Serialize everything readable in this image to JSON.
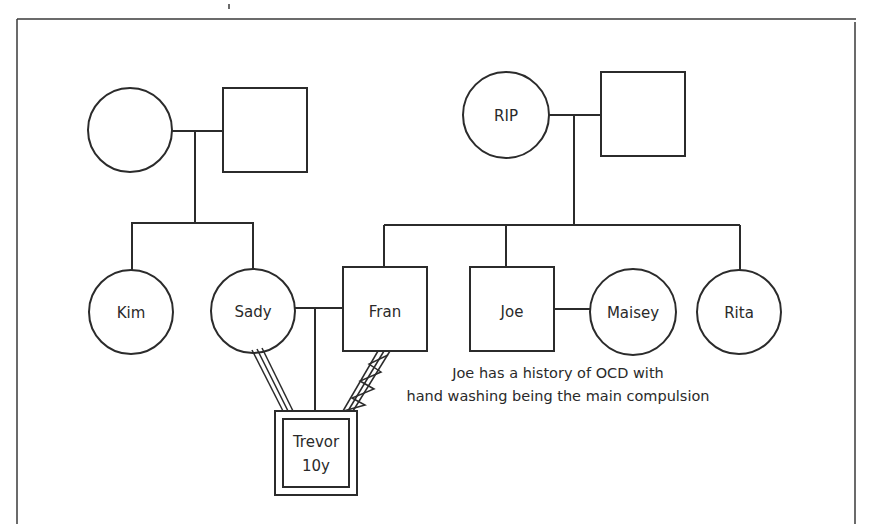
{
  "diagram": {
    "type": "genogram",
    "colors": {
      "stroke": "#2b2b2b",
      "background": "#ffffff",
      "text": "#2a2a2a"
    }
  },
  "people": {
    "grandmother_left": {
      "label": "",
      "shape": "circle"
    },
    "grandfather_left": {
      "label": "",
      "shape": "square"
    },
    "grandmother_right": {
      "label": "RIP",
      "shape": "circle"
    },
    "grandfather_right": {
      "label": "",
      "shape": "square"
    },
    "kim": {
      "label": "Kim",
      "shape": "circle"
    },
    "sady": {
      "label": "Sady",
      "shape": "circle"
    },
    "fran": {
      "label": "Fran",
      "shape": "square"
    },
    "joe": {
      "label": "Joe",
      "shape": "square"
    },
    "maisey": {
      "label": "Maisey",
      "shape": "circle"
    },
    "rita": {
      "label": "Rita",
      "shape": "circle"
    },
    "trevor": {
      "label": "Trevor",
      "age": "10y",
      "shape": "double-square",
      "role": "index-person"
    }
  },
  "relationships": [
    {
      "from": "grandmother_left",
      "to": "grandfather_left",
      "type": "marriage"
    },
    {
      "from": "grandmother_right",
      "to": "grandfather_right",
      "type": "marriage"
    },
    {
      "from": "sady",
      "to": "fran",
      "type": "marriage"
    },
    {
      "from": "joe",
      "to": "maisey",
      "type": "marriage"
    },
    {
      "from": "sady",
      "to": "trevor",
      "type": "close"
    },
    {
      "from": "fran",
      "to": "trevor",
      "type": "close-conflicted"
    }
  ],
  "annotation": {
    "line1": "Joe has a history of OCD with",
    "line2": "hand washing being the main compulsion"
  }
}
